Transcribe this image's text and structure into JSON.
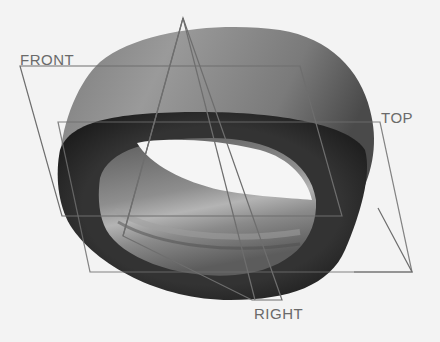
{
  "viewport": {
    "background": "#f3f3f3",
    "model": "ring-bushing-part"
  },
  "datums": {
    "front": {
      "label": "FRONT",
      "color": "#6e6e6e"
    },
    "top": {
      "label": "TOP",
      "color": "#6e6e6e"
    },
    "right": {
      "label": "RIGHT",
      "color": "#6e6e6e"
    }
  },
  "colors": {
    "outer_surface": "#8a8a8a",
    "top_face_dark": "#2a2a2a",
    "inner_surface": "#7a7a7a",
    "inner_highlight": "#b0b0b0",
    "hole": "#f5f5f5",
    "datum_line": "#6e6e6e"
  }
}
